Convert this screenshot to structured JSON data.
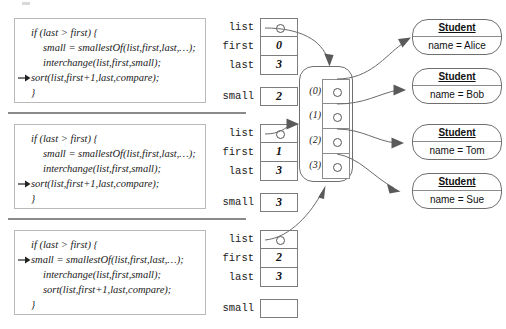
{
  "diagram": {
    "frames": [
      {
        "id": "frame-0",
        "active_line": 3,
        "code": [
          {
            "text": "if (last > first) {",
            "indent": 0
          },
          {
            "text": "small = smallestOf(list,first,last,…);",
            "indent": 1
          },
          {
            "text": "interchange(list,first,small);",
            "indent": 1
          },
          {
            "text": "sort(list,first+1,last,compare);",
            "indent": 0
          },
          {
            "text": "}",
            "indent": 0
          }
        ],
        "vars": [
          {
            "name": "list",
            "value": "",
            "pointer": true
          },
          {
            "name": "first",
            "value": "0",
            "pointer": false
          },
          {
            "name": "last",
            "value": "3",
            "pointer": false
          },
          {
            "name": "small",
            "value": "2",
            "pointer": false
          }
        ]
      },
      {
        "id": "frame-1",
        "active_line": 3,
        "code": [
          {
            "text": "if (last > first) {",
            "indent": 0
          },
          {
            "text": "small = smallestOf(list,first,last,…);",
            "indent": 1
          },
          {
            "text": "interchange(list,first,small);",
            "indent": 1
          },
          {
            "text": "sort(list,first+1,last,compare);",
            "indent": 0
          },
          {
            "text": "}",
            "indent": 0
          }
        ],
        "vars": [
          {
            "name": "list",
            "value": "",
            "pointer": true
          },
          {
            "name": "first",
            "value": "1",
            "pointer": false
          },
          {
            "name": "last",
            "value": "3",
            "pointer": false
          },
          {
            "name": "small",
            "value": "3",
            "pointer": false
          }
        ]
      },
      {
        "id": "frame-2",
        "active_line": 1,
        "code": [
          {
            "text": "if (last > first) {",
            "indent": 0
          },
          {
            "text": "small = smallestOf(list,first,last,…);",
            "indent": 0
          },
          {
            "text": "interchange(list,first,small);",
            "indent": 1
          },
          {
            "text": "sort(list,first+1,last,compare);",
            "indent": 1
          },
          {
            "text": "}",
            "indent": 0
          }
        ],
        "vars": [
          {
            "name": "list",
            "value": "",
            "pointer": true
          },
          {
            "name": "first",
            "value": "2",
            "pointer": false
          },
          {
            "name": "last",
            "value": "3",
            "pointer": false
          },
          {
            "name": "small",
            "value": "",
            "pointer": false
          }
        ]
      }
    ],
    "array_object": {
      "name": "student-array",
      "slots": [
        {
          "index": "(0)",
          "pointer": true
        },
        {
          "index": "(1)",
          "pointer": true
        },
        {
          "index": "(2)",
          "pointer": true
        },
        {
          "index": "(3)",
          "pointer": true
        }
      ]
    },
    "students": [
      {
        "type": "Student",
        "field": "name = Alice"
      },
      {
        "type": "Student",
        "field": "name = Bob"
      },
      {
        "type": "Student",
        "field": "name = Tom"
      },
      {
        "type": "Student",
        "field": "name = Sue"
      }
    ],
    "colors": {
      "line": "#6b6b6b",
      "arrowhead": "#5a5a5a",
      "box_border": "#7d7d7d",
      "divider": "#8a8a8a",
      "text": "#111111"
    }
  }
}
